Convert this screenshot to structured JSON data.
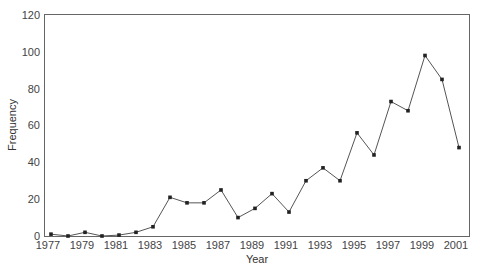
{
  "chart_data": {
    "type": "line",
    "title": "",
    "xlabel": "Year",
    "ylabel": "Frequency",
    "x": [
      1977,
      1978,
      1979,
      1980,
      1981,
      1982,
      1983,
      1984,
      1985,
      1986,
      1987,
      1988,
      1989,
      1990,
      1991,
      1992,
      1993,
      1994,
      1995,
      1996,
      1997,
      1998,
      1999,
      2000,
      2001
    ],
    "series": [
      {
        "name": "Frequency",
        "values": [
          1,
          0,
          2,
          0,
          0.5,
          2,
          5,
          21,
          18,
          18,
          25,
          10,
          15,
          23,
          13,
          30,
          37,
          30,
          56,
          44,
          73,
          68,
          98,
          85,
          48
        ]
      }
    ],
    "xticks": [
      "1977",
      "1979",
      "1981",
      "1983",
      "1985",
      "1987",
      "1989",
      "1991",
      "1993",
      "1995",
      "1997",
      "1999",
      "2001"
    ],
    "yticks": [
      "0",
      "20",
      "40",
      "60",
      "80",
      "100",
      "120"
    ],
    "ylim": [
      0,
      120
    ],
    "xlim": [
      1977,
      2001
    ],
    "grid": false,
    "legend": null,
    "line_color": "#555555",
    "marker": "square"
  }
}
